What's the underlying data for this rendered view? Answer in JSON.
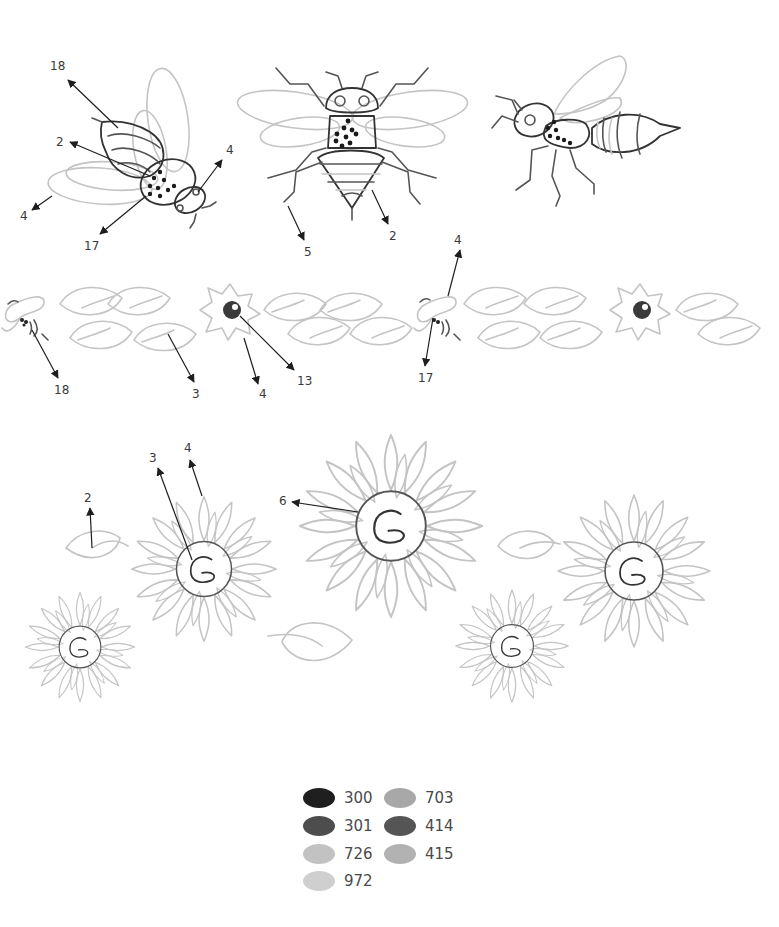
{
  "pattern": {
    "sections": [
      {
        "name": "bees",
        "motifs": [
          "bee-side-left",
          "bee-top-center",
          "wasp-side-right"
        ],
        "callouts": [
          {
            "label": "18",
            "target": "bee-left-abdomen-tip"
          },
          {
            "label": "2",
            "target": "bee-left-abdomen"
          },
          {
            "label": "4",
            "target": "bee-left-head-eye"
          },
          {
            "label": "4",
            "target": "bee-left-wing"
          },
          {
            "label": "17",
            "target": "bee-left-thorax"
          },
          {
            "label": "5",
            "target": "bee-center-leg"
          },
          {
            "label": "2",
            "target": "bee-center-abdomen"
          }
        ]
      },
      {
        "name": "border",
        "motifs": [
          "small-bee",
          "leaves",
          "small-flower",
          "small-bee",
          "leaves",
          "small-flower"
        ],
        "callouts": [
          {
            "label": "18",
            "target": "small-bee-body"
          },
          {
            "label": "3",
            "target": "leaf-vein"
          },
          {
            "label": "4",
            "target": "flower-petals"
          },
          {
            "label": "13",
            "target": "flower-center"
          },
          {
            "label": "4",
            "target": "small-bee-wing"
          },
          {
            "label": "17",
            "target": "small-bee-stripes"
          }
        ]
      },
      {
        "name": "sunflowers",
        "motifs": [
          "leaf",
          "sunflower-small",
          "sunflower-medium",
          "sunflower-large",
          "leaf",
          "sunflower-small",
          "leaf",
          "sunflower-medium"
        ],
        "callouts": [
          {
            "label": "2",
            "target": "leaf-vein"
          },
          {
            "label": "3",
            "target": "sunflower-spiral"
          },
          {
            "label": "4",
            "target": "sunflower-petals"
          },
          {
            "label": "6",
            "target": "sunflower-center-circle"
          }
        ]
      }
    ],
    "labels": {
      "a1": "18",
      "a2": "2",
      "a3": "4",
      "a4": "4",
      "a5": "17",
      "b1": "5",
      "b2": "2",
      "c1": "18",
      "c2": "3",
      "c3": "4",
      "c4": "13",
      "c5": "4",
      "c6": "17",
      "d1": "2",
      "d2": "3",
      "d3": "4",
      "d4": "6"
    }
  },
  "legend": {
    "title": "",
    "items": [
      {
        "code": "300",
        "color": "#1f1f1f"
      },
      {
        "code": "301",
        "color": "#4d4d4d"
      },
      {
        "code": "726",
        "color": "#c2c2c2"
      },
      {
        "code": "972",
        "color": "#cfcfcf"
      },
      {
        "code": "703",
        "color": "#a8a8a8"
      },
      {
        "code": "414",
        "color": "#555555"
      },
      {
        "code": "415",
        "color": "#b2b2b2"
      }
    ]
  }
}
